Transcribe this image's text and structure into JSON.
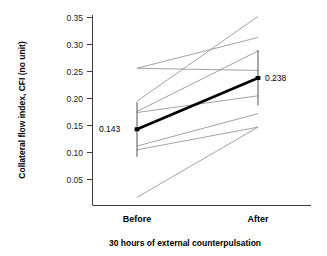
{
  "chart_data": {
    "type": "line",
    "title": "",
    "xlabel": "30 hours of external counterpulsation",
    "ylabel": "Collateral flow index, CFI (no unit)",
    "categories": [
      "Before",
      "After"
    ],
    "ytick_labels": [
      "0.35",
      "0.30",
      "0.25",
      "0.20",
      "0.15",
      "0.10",
      "0.05"
    ],
    "ytick_values": [
      0.35,
      0.3,
      0.25,
      0.2,
      0.15,
      0.1,
      0.05
    ],
    "ylim": [
      0.0,
      0.35
    ],
    "grid": false,
    "legend": "none",
    "series": [
      {
        "name": "subject-1",
        "values": [
          0.195,
          0.352
        ]
      },
      {
        "name": "subject-2",
        "values": [
          0.256,
          0.313
        ]
      },
      {
        "name": "subject-3",
        "values": [
          0.176,
          0.288
        ]
      },
      {
        "name": "subject-4",
        "values": [
          0.256,
          0.252
        ]
      },
      {
        "name": "subject-5",
        "values": [
          0.174,
          0.205
        ]
      },
      {
        "name": "subject-6",
        "values": [
          0.112,
          0.172
        ]
      },
      {
        "name": "subject-7",
        "values": [
          0.105,
          0.147
        ]
      },
      {
        "name": "subject-8",
        "values": [
          0.017,
          0.147
        ]
      }
    ],
    "mean_series": {
      "name": "mean",
      "values": [
        0.143,
        0.238
      ],
      "labels": [
        "0.143",
        "0.238"
      ],
      "error_bars": [
        {
          "category": "Before",
          "low": 0.092,
          "high": 0.193
        },
        {
          "category": "After",
          "low": 0.187,
          "high": 0.29
        }
      ]
    },
    "colors": {
      "mean_line": "#000000",
      "subject_line": "#8c8c8c",
      "axis": "#3d3d3d",
      "text": "#000000"
    }
  },
  "labels": {
    "y_tick_0": "0.35",
    "y_tick_1": "0.30",
    "y_tick_2": "0.25",
    "y_tick_3": "0.20",
    "y_tick_4": "0.15",
    "y_tick_5": "0.10",
    "y_tick_6": "0.05",
    "x_cat_0": "Before",
    "x_cat_1": "After",
    "x_axis_title": "30 hours of external counterpulsation",
    "y_axis_title": "Collateral flow index, CFI (no unit)",
    "mean_before_value": "0.143",
    "mean_after_value": "0.238"
  }
}
